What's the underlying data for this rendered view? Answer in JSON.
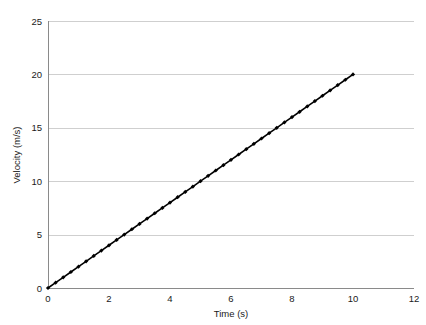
{
  "chart_data": {
    "type": "line",
    "title": "",
    "subtitle": "",
    "xlabel": "Time (s)",
    "ylabel": "Velocity (m/s)",
    "xlim": [
      0,
      12
    ],
    "ylim": [
      0,
      25
    ],
    "xticks": [
      0,
      2,
      4,
      6,
      8,
      10,
      12
    ],
    "yticks": [
      0,
      5,
      10,
      15,
      20,
      25
    ],
    "xtick_labels": [
      "0",
      "2",
      "4",
      "6",
      "8",
      "10",
      "12"
    ],
    "ytick_labels": [
      "0",
      "5",
      "10",
      "15",
      "20",
      "25"
    ],
    "grid": "horizontal",
    "legend": "none",
    "annotations": [],
    "series": [
      {
        "name": "Velocity",
        "color": "#000000",
        "marker": "diamond",
        "line_style": "solid",
        "x": [
          0,
          0.25,
          0.5,
          0.75,
          1,
          1.25,
          1.5,
          1.75,
          2,
          2.25,
          2.5,
          2.75,
          3,
          3.25,
          3.5,
          3.75,
          4,
          4.25,
          4.5,
          4.75,
          5,
          5.25,
          5.5,
          5.75,
          6,
          6.25,
          6.5,
          6.75,
          7,
          7.25,
          7.5,
          7.75,
          8,
          8.25,
          8.5,
          8.75,
          9,
          9.25,
          9.5,
          9.75,
          10
        ],
        "y": [
          0,
          0.5,
          1,
          1.5,
          2,
          2.5,
          3,
          3.5,
          4,
          4.5,
          5,
          5.5,
          6,
          6.5,
          7,
          7.5,
          8,
          8.5,
          9,
          9.5,
          10,
          10.5,
          11,
          11.5,
          12,
          12.5,
          13,
          13.5,
          14,
          14.5,
          15,
          15.5,
          16,
          16.5,
          17,
          17.5,
          18,
          18.5,
          19,
          19.5,
          20
        ]
      }
    ]
  },
  "colors": {
    "background": "#ffffff",
    "gridline": "#cfcfcf",
    "axis": "#8a8a8a",
    "series": "#000000",
    "text": "#1a1a1a"
  }
}
